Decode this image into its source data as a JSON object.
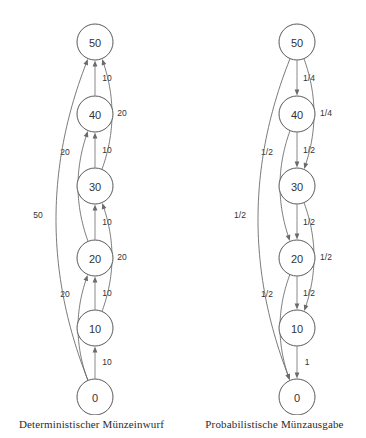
{
  "figure": {
    "title_left": "Deterministischer Münzeinwurf",
    "title_right": "Probabilistische Münzausgabe",
    "stroke_color": "#6b6b6b",
    "node_stroke_color": "#5a5a5a",
    "text_color": "#333333",
    "background": "#ffffff"
  },
  "chart_data": {
    "type": "diagram",
    "title": "",
    "panels": [
      {
        "id": "deterministic",
        "caption": "Deterministischer Münzeinwurf",
        "direction": "upward",
        "nodes": [
          {
            "id": "n50",
            "label": "50",
            "cx": 95,
            "cy": 42,
            "r": 18
          },
          {
            "id": "n40",
            "label": "40",
            "cx": 95,
            "cy": 114,
            "r": 18
          },
          {
            "id": "n30",
            "label": "30",
            "cx": 95,
            "cy": 186,
            "r": 18
          },
          {
            "id": "n20",
            "label": "20",
            "cx": 95,
            "cy": 258,
            "r": 18
          },
          {
            "id": "n10",
            "label": "10",
            "cx": 95,
            "cy": 328,
            "r": 18
          },
          {
            "id": "n0",
            "label": "0",
            "cx": 95,
            "cy": 397,
            "r": 18
          }
        ],
        "edges": [
          {
            "from": "n0",
            "to": "n10",
            "label": "10",
            "label_x": 107,
            "label_y": 362,
            "shape": "straight"
          },
          {
            "from": "n10",
            "to": "n20",
            "label": "10",
            "label_x": 107,
            "label_y": 293,
            "shape": "straight"
          },
          {
            "from": "n20",
            "to": "n30",
            "label": "10",
            "label_x": 107,
            "label_y": 222,
            "shape": "straight"
          },
          {
            "from": "n30",
            "to": "n40",
            "label": "10",
            "label_x": 107,
            "label_y": 150,
            "shape": "straight"
          },
          {
            "from": "n40",
            "to": "n50",
            "label": "10",
            "label_x": 107,
            "label_y": 78,
            "shape": "straight"
          },
          {
            "from": "n10",
            "to": "n30",
            "label": "20",
            "label_x": 122,
            "label_y": 257,
            "shape": "curve-right"
          },
          {
            "from": "n30",
            "to": "n50",
            "label": "20",
            "label_x": 122,
            "label_y": 113,
            "shape": "curve-right"
          },
          {
            "from": "n0",
            "to": "n20",
            "label": "20",
            "label_x": 65,
            "label_y": 294,
            "shape": "curve-left"
          },
          {
            "from": "n20",
            "to": "n40",
            "label": "20",
            "label_x": 65,
            "label_y": 152,
            "shape": "curve-left"
          },
          {
            "from": "n0",
            "to": "n50",
            "label": "50",
            "label_x": 38,
            "label_y": 215,
            "shape": "curve-far-left"
          }
        ]
      },
      {
        "id": "probabilistic",
        "caption": "Probabilistische Münzausgabe",
        "direction": "downward",
        "nodes": [
          {
            "id": "p50",
            "label": "50",
            "cx": 114,
            "cy": 42,
            "r": 18
          },
          {
            "id": "p40",
            "label": "40",
            "cx": 114,
            "cy": 114,
            "r": 18
          },
          {
            "id": "p30",
            "label": "30",
            "cx": 114,
            "cy": 186,
            "r": 18
          },
          {
            "id": "p20",
            "label": "20",
            "cx": 114,
            "cy": 258,
            "r": 18
          },
          {
            "id": "p10",
            "label": "10",
            "cx": 114,
            "cy": 328,
            "r": 18
          },
          {
            "id": "p0",
            "label": "0",
            "cx": 114,
            "cy": 397,
            "r": 18
          }
        ],
        "edges": [
          {
            "from": "p50",
            "to": "p40",
            "label": "1/4",
            "label_x": 126,
            "label_y": 78,
            "shape": "straight"
          },
          {
            "from": "p40",
            "to": "p30",
            "label": "1/2",
            "label_x": 126,
            "label_y": 150,
            "shape": "straight"
          },
          {
            "from": "p30",
            "to": "p20",
            "label": "1/2",
            "label_x": 126,
            "label_y": 222,
            "shape": "straight"
          },
          {
            "from": "p20",
            "to": "p10",
            "label": "1/2",
            "label_x": 126,
            "label_y": 293,
            "shape": "straight"
          },
          {
            "from": "p10",
            "to": "p0",
            "label": "1",
            "label_x": 124,
            "label_y": 362,
            "shape": "straight"
          },
          {
            "from": "p50",
            "to": "p30",
            "label": "1/4",
            "label_x": 143,
            "label_y": 113,
            "shape": "curve-right"
          },
          {
            "from": "p30",
            "to": "p10",
            "label": "1/2",
            "label_x": 143,
            "label_y": 257,
            "shape": "curve-right"
          },
          {
            "from": "p40",
            "to": "p20",
            "label": "1/2",
            "label_x": 84,
            "label_y": 152,
            "shape": "curve-left"
          },
          {
            "from": "p20",
            "to": "p0",
            "label": "1/2",
            "label_x": 84,
            "label_y": 294,
            "shape": "curve-left"
          },
          {
            "from": "p50",
            "to": "p0",
            "label": "1/2",
            "label_x": 57,
            "label_y": 215,
            "shape": "curve-far-left"
          }
        ]
      }
    ]
  }
}
